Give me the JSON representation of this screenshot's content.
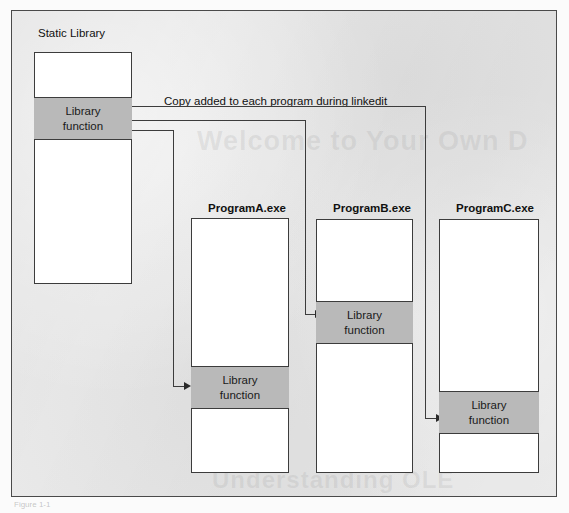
{
  "figure": {
    "caption_below": "Figure 1-1",
    "annotation": "Copy added to each program during linkedit"
  },
  "library": {
    "title": "Static Library",
    "band_line1": "Library",
    "band_line2": "function"
  },
  "programs": [
    {
      "title": "ProgramA.exe",
      "band_line1": "Library",
      "band_line2": "function"
    },
    {
      "title": "ProgramB.exe",
      "band_line1": "Library",
      "band_line2": "function"
    },
    {
      "title": "ProgramC.exe",
      "band_line1": "Library",
      "band_line2": "function"
    }
  ],
  "ghost_text": {
    "line1": "Welcome to Your Own D",
    "line2": "Understanding OLE"
  },
  "colors": {
    "frame_fill": "#e9e9e9",
    "frame_border": "#4a4a4a",
    "box_fill": "#ffffff",
    "box_border": "#3c3c3c",
    "band_fill": "#b9b9b9",
    "text": "#111111"
  }
}
